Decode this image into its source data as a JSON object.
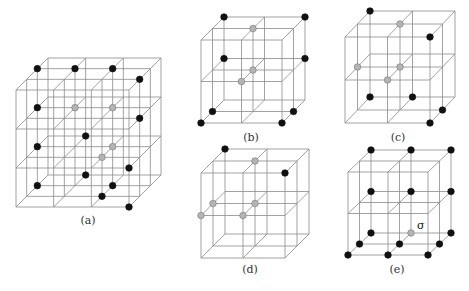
{
  "figure": {
    "colors": {
      "line": "#8a8a8a",
      "black_site": "#111111",
      "gray_site": "#b4b4b4",
      "gray_site_stroke": "#777777"
    },
    "panels": [
      {
        "id": "a",
        "label": "(a)",
        "label_pos": [
          88,
          224
        ],
        "cells": 3,
        "front_origin": [
          16,
          90
        ],
        "front_size": [
          113,
          117
        ],
        "depth_offset": [
          32,
          -32
        ],
        "sites": [
          {
            "i": 0,
            "j": 0,
            "k": 2,
            "c": "black"
          },
          {
            "i": 1,
            "j": 0,
            "k": 2,
            "c": "black"
          },
          {
            "i": 2,
            "j": 0,
            "k": 2,
            "c": "black"
          },
          {
            "i": 3,
            "j": 0,
            "k": 1,
            "c": "black"
          },
          {
            "i": 0,
            "j": 1,
            "k": 2,
            "c": "black"
          },
          {
            "i": 1,
            "j": 1,
            "k": 2,
            "c": "gray"
          },
          {
            "i": 2,
            "j": 1,
            "k": 2,
            "c": "gray"
          },
          {
            "i": 3,
            "j": 1,
            "k": 1,
            "c": "black"
          },
          {
            "i": 1,
            "j": 2,
            "k": 3,
            "c": "black"
          },
          {
            "i": 0,
            "j": 2,
            "k": 2,
            "c": "black"
          },
          {
            "i": 2,
            "j": 2,
            "k": 2,
            "c": "gray"
          },
          {
            "i": 2,
            "j": 2,
            "k": 1,
            "c": "gray"
          },
          {
            "i": 3,
            "j": 2,
            "k": 0,
            "c": "black"
          },
          {
            "i": 1,
            "j": 3,
            "k": 3,
            "c": "black"
          },
          {
            "i": 0,
            "j": 3,
            "k": 2,
            "c": "black"
          },
          {
            "i": 2,
            "j": 3,
            "k": 2,
            "c": "black"
          },
          {
            "i": 2,
            "j": 3,
            "k": 1,
            "c": "black"
          },
          {
            "i": 3,
            "j": 3,
            "k": 0,
            "c": "black"
          }
        ]
      },
      {
        "id": "b",
        "label": "(b)",
        "label_pos": [
          251,
          141
        ],
        "cells": 2,
        "front_origin": [
          201,
          40
        ],
        "front_size": [
          81,
          83
        ],
        "depth_offset": [
          23,
          -23
        ],
        "sites": [
          {
            "i": 0,
            "j": 0,
            "k": 2,
            "c": "black"
          },
          {
            "i": 2,
            "j": 0,
            "k": 2,
            "c": "black"
          },
          {
            "i": 1,
            "j": 0,
            "k": 1,
            "c": "gray"
          },
          {
            "i": 0,
            "j": 1,
            "k": 2,
            "c": "black"
          },
          {
            "i": 2,
            "j": 1,
            "k": 2,
            "c": "black"
          },
          {
            "i": 1,
            "j": 1,
            "k": 1,
            "c": "gray"
          },
          {
            "i": 1,
            "j": 1,
            "k": 0,
            "c": "gray"
          },
          {
            "i": 0,
            "j": 2,
            "k": 1,
            "c": "black"
          },
          {
            "i": 0,
            "j": 2,
            "k": 0,
            "c": "black"
          },
          {
            "i": 2,
            "j": 2,
            "k": 1,
            "c": "black"
          },
          {
            "i": 2,
            "j": 2,
            "k": 0,
            "c": "black"
          }
        ]
      },
      {
        "id": "c",
        "label": "(c)",
        "label_pos": [
          398,
          141
        ],
        "cells": 2,
        "front_origin": [
          345,
          37
        ],
        "front_size": [
          85,
          86
        ],
        "depth_offset": [
          25,
          -26
        ],
        "sites": [
          {
            "i": 0,
            "j": 0,
            "k": 2,
            "c": "black"
          },
          {
            "i": 1,
            "j": 0,
            "k": 1,
            "c": "gray"
          },
          {
            "i": 2,
            "j": 0,
            "k": 0,
            "c": "black"
          },
          {
            "i": 0,
            "j": 1,
            "k": 1,
            "c": "gray"
          },
          {
            "i": 1,
            "j": 1,
            "k": 1,
            "c": "gray"
          },
          {
            "i": 1,
            "j": 1,
            "k": 0,
            "c": "gray"
          },
          {
            "i": 0,
            "j": 2,
            "k": 2,
            "c": "black"
          },
          {
            "i": 1,
            "j": 2,
            "k": 2,
            "c": "black"
          },
          {
            "i": 2,
            "j": 2,
            "k": 1,
            "c": "black"
          },
          {
            "i": 2,
            "j": 2,
            "k": 0,
            "c": "black"
          }
        ]
      },
      {
        "id": "d",
        "label": "(d)",
        "label_pos": [
          250,
          273
        ],
        "cells": 2,
        "front_origin": [
          201,
          173
        ],
        "front_size": [
          84,
          85
        ],
        "depth_offset": [
          24,
          -24
        ],
        "sites": [
          {
            "i": 0,
            "j": 0,
            "k": 2,
            "c": "black"
          },
          {
            "i": 1,
            "j": 0,
            "k": 1,
            "c": "gray"
          },
          {
            "i": 2,
            "j": 0,
            "k": 0,
            "c": "black"
          },
          {
            "i": 0,
            "j": 1,
            "k": 1,
            "c": "gray"
          },
          {
            "i": 0,
            "j": 1,
            "k": 0,
            "c": "gray"
          },
          {
            "i": 1,
            "j": 1,
            "k": 1,
            "c": "gray"
          },
          {
            "i": 1,
            "j": 1,
            "k": 0,
            "c": "gray"
          }
        ]
      },
      {
        "id": "e",
        "label": "(e)",
        "label_pos": [
          397,
          273
        ],
        "cells": 2,
        "front_origin": [
          348,
          172
        ],
        "front_size": [
          80,
          83
        ],
        "depth_offset": [
          23,
          -22
        ],
        "annotation": {
          "text": "σ",
          "pos": [
            417,
            229
          ]
        },
        "sites": [
          {
            "i": 0,
            "j": 0,
            "k": 2,
            "c": "black"
          },
          {
            "i": 1,
            "j": 0,
            "k": 2,
            "c": "black"
          },
          {
            "i": 2,
            "j": 0,
            "k": 2,
            "c": "black"
          },
          {
            "i": 0,
            "j": 1,
            "k": 2,
            "c": "black"
          },
          {
            "i": 1,
            "j": 1,
            "k": 2,
            "c": "black"
          },
          {
            "i": 2,
            "j": 1,
            "k": 2,
            "c": "black"
          },
          {
            "i": 0,
            "j": 2,
            "k": 2,
            "c": "black"
          },
          {
            "i": 1,
            "j": 2,
            "k": 2,
            "c": "gray"
          },
          {
            "i": 2,
            "j": 2,
            "k": 2,
            "c": "black"
          },
          {
            "i": 0,
            "j": 2,
            "k": 1,
            "c": "black"
          },
          {
            "i": 1,
            "j": 2,
            "k": 1,
            "c": "black"
          },
          {
            "i": 2,
            "j": 2,
            "k": 1,
            "c": "black"
          },
          {
            "i": 0,
            "j": 2,
            "k": 0,
            "c": "black"
          },
          {
            "i": 1,
            "j": 2,
            "k": 0,
            "c": "black"
          },
          {
            "i": 2,
            "j": 2,
            "k": 0,
            "c": "black"
          }
        ]
      }
    ]
  }
}
